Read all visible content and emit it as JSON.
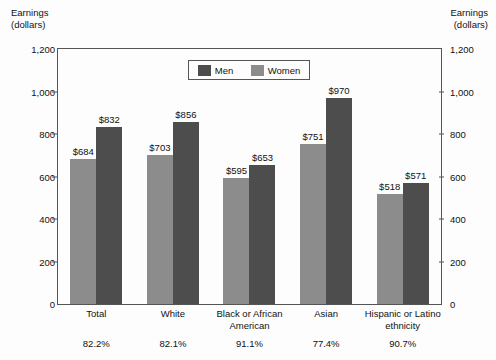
{
  "axis_title_left": "Earnings\n(dollars)",
  "axis_title_right": "Earnings\n(dollars)",
  "legend": {
    "men_label": "Men",
    "women_label": "Women"
  },
  "colors": {
    "men": "#4d4d4d",
    "women": "#8c8c8c",
    "frame": "#555555",
    "background": "#fdfdfd"
  },
  "chart_data": {
    "type": "bar",
    "title": "",
    "xlabel": "",
    "ylabel": "Earnings (dollars)",
    "ylim": [
      0,
      1200
    ],
    "yticks": [
      0,
      200,
      400,
      600,
      800,
      1000,
      1200
    ],
    "ytick_labels": [
      "0",
      "200",
      "400",
      "600",
      "800",
      "1,000",
      "1,200"
    ],
    "grid": false,
    "legend_position": "top-center",
    "dual_axis": true,
    "categories": [
      "Total",
      "White",
      "Black or African\nAmerican",
      "Asian",
      "Hispanic or Latino\nethnicity"
    ],
    "series": [
      {
        "name": "Women",
        "values": [
          684,
          703,
          595,
          751,
          518
        ],
        "labels": [
          "$684",
          "$703",
          "$595",
          "$751",
          "$518"
        ],
        "color": "#8c8c8c"
      },
      {
        "name": "Men",
        "values": [
          832,
          856,
          653,
          970,
          571
        ],
        "labels": [
          "$832",
          "$856",
          "$653",
          "$970",
          "$571"
        ],
        "color": "#4d4d4d"
      }
    ],
    "annotations": {
      "note": "Womens earnings as percent of mens earnings, shown below each category",
      "percent_labels": [
        "82.2%",
        "82.1%",
        "91.1%",
        "77.4%",
        "90.7%"
      ]
    }
  }
}
